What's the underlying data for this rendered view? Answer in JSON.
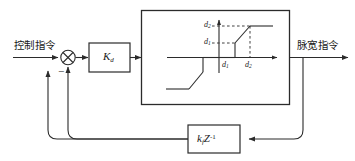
{
  "diagram": {
    "stroke_color": "#2b2b2b",
    "text_color": "#1a1a1a",
    "input_label": "控制指令",
    "output_label": "脉宽指令",
    "sign_label": "−",
    "gain_block": {
      "symbol": "K",
      "subscript": "d"
    },
    "feedback_block": {
      "symbol": "k",
      "subscript": "f",
      "operator": "Z",
      "exponent": "-1"
    },
    "nonlinearity": {
      "name": "dead-zone saturation characteristic",
      "y_tick_upper": "d",
      "y_tick_upper_sub": "2",
      "y_tick_lower": "d",
      "y_tick_lower_sub": "1",
      "x_tick_first": "d",
      "x_tick_first_sub": "1",
      "x_tick_second": "d",
      "x_tick_second_sub": "2"
    }
  }
}
